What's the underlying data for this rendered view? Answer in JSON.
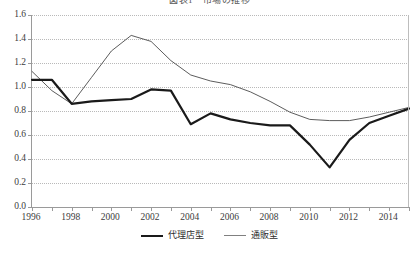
{
  "chart_data": {
    "type": "line",
    "title": "図表1　市場の推移",
    "xlabel": "",
    "ylabel": "",
    "x": [
      1996,
      1997,
      1998,
      1999,
      2000,
      2001,
      2002,
      2003,
      2004,
      2005,
      2006,
      2007,
      2008,
      2009,
      2010,
      2011,
      2012,
      2013,
      2014,
      2015
    ],
    "xlim": [
      1996,
      2015
    ],
    "ylim": [
      0.0,
      1.6
    ],
    "ytick_labels": [
      "0.0",
      "0.2",
      "0.4",
      "0.6",
      "0.8",
      "1.0",
      "1.2",
      "1.4",
      "1.6"
    ],
    "ytick_values": [
      0.0,
      0.2,
      0.4,
      0.6,
      0.8,
      1.0,
      1.2,
      1.4,
      1.6
    ],
    "xtick_values": [
      1996,
      1997,
      1998,
      1999,
      2000,
      2001,
      2002,
      2003,
      2004,
      2005,
      2006,
      2007,
      2008,
      2009,
      2010,
      2011,
      2012,
      2013,
      2014,
      2015
    ],
    "xtick_labels": [
      "1996",
      "",
      "1998",
      "",
      "2000",
      "",
      "2002",
      "",
      "2004",
      "",
      "2006",
      "",
      "2008",
      "",
      "2010",
      "",
      "2012",
      "",
      "2014",
      ""
    ],
    "grid": true,
    "grid_axis": "y",
    "legend_position": "bottom",
    "series": [
      {
        "name": "代理店型",
        "style": "thick",
        "color": "#1a1a1a",
        "values": [
          1.06,
          1.06,
          0.86,
          0.88,
          0.89,
          0.9,
          0.98,
          0.97,
          0.69,
          0.78,
          0.73,
          0.7,
          0.68,
          0.68,
          0.52,
          0.33,
          0.56,
          0.7,
          0.76,
          0.82
        ]
      },
      {
        "name": "通販型",
        "style": "thin",
        "color": "#4a4a4a",
        "values": [
          1.13,
          0.97,
          0.86,
          1.08,
          1.3,
          1.43,
          1.38,
          1.22,
          1.1,
          1.05,
          1.02,
          0.96,
          0.88,
          0.79,
          0.73,
          0.72,
          0.72,
          0.75,
          0.79,
          0.83
        ]
      }
    ]
  },
  "legend": {
    "items": [
      {
        "label": "代理店型"
      },
      {
        "label": "通販型"
      }
    ]
  }
}
